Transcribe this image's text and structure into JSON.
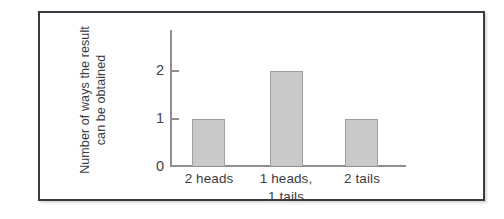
{
  "chart_data": {
    "type": "bar",
    "title": "",
    "subtitle": "",
    "xlabel": "",
    "ylabel": "Number of ways the result can be obtained",
    "ylabel_lines": [
      "Number of ways the result",
      "can be obtained"
    ],
    "categories": [
      "2 heads",
      "1 heads, 1 tails",
      "2 tails"
    ],
    "category_lines": [
      [
        "2 heads"
      ],
      [
        "1 heads,",
        "1 tails"
      ],
      [
        "2 tails"
      ]
    ],
    "values": [
      1,
      2,
      1
    ],
    "ylim": [
      0,
      2.35
    ],
    "yticks": [
      0,
      1,
      2
    ],
    "ytick_labels": [
      "0",
      "1",
      "2"
    ],
    "grid": false,
    "legend": false,
    "legend_position": "none",
    "bar_fill_color": "#c9c9c9",
    "bar_border_color": "#a0a0a4",
    "axis_color": "#8d8d93",
    "text_color": "#3c3c41",
    "frame_color": "#3a3a42",
    "background_color": "#ffffff"
  },
  "figure": {
    "frame_label": "chart-frame"
  }
}
